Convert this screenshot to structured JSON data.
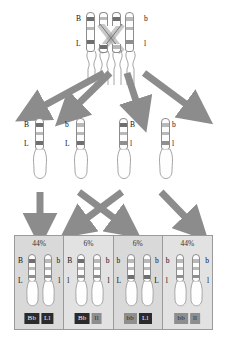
{
  "diagram": {
    "colors": {
      "arrow_gray": "#8c8c8c",
      "panel_bg": "#d9d9d9",
      "panel_bg_alt": "#e2e2e2",
      "band_dark": "#6f6f6f",
      "band_light": "#b9b9b9",
      "geno_dark_bg": "#2b2b2b",
      "geno_grey_bg": "#8e8e8e",
      "outline": "#8d8d8d"
    }
  },
  "tetrad": {
    "stage_label": "tetrad-with-chiasma",
    "left_allele_top": "B",
    "left_allele_bottom": "L",
    "right_allele_top": "b",
    "right_allele_bottom": "l",
    "chromatid_count": 4
  },
  "gametes": {
    "stage_label": "four-gametes",
    "items": [
      {
        "name": "gamete-BL",
        "top": "B",
        "bottom": "L",
        "label_side": "left"
      },
      {
        "name": "gamete-bL",
        "top": "b",
        "bottom": "L",
        "label_side": "left"
      },
      {
        "name": "gamete-Bl",
        "top": "B",
        "bottom": "l",
        "label_side": "right"
      },
      {
        "name": "gamete-bl",
        "top": "b",
        "bottom": "l",
        "label_side": "right"
      }
    ]
  },
  "offspring": {
    "stage_label": "offspring-genotype-classes",
    "cells": [
      {
        "name": "class-parental-BbLl",
        "percent": "44%",
        "left_top": "B",
        "left_bottom": "L",
        "right_top": "b",
        "right_bottom": "l",
        "geno_1": "Bb",
        "geno_1_style": "dark",
        "geno_2": "Ll",
        "geno_2_style": "dark",
        "shade": "dark"
      },
      {
        "name": "class-recombinant-Bbll",
        "percent": "6%",
        "left_top": "B",
        "left_bottom": "l",
        "right_top": "b",
        "right_bottom": "l",
        "geno_1": "Bb",
        "geno_1_style": "dark",
        "geno_2": "ll",
        "geno_2_style": "grey",
        "shade": "light"
      },
      {
        "name": "class-recombinant-bbLl",
        "percent": "6%",
        "left_top": "b",
        "left_bottom": "L",
        "right_top": "b",
        "right_bottom": "L",
        "geno_1": "bb",
        "geno_1_style": "grey",
        "geno_2": "Ll",
        "geno_2_style": "dark",
        "shade": "dark"
      },
      {
        "name": "class-parental-bbll",
        "percent": "44%",
        "left_top": "b",
        "left_bottom": "l",
        "right_top": "b",
        "right_bottom": "l",
        "geno_1": "bb",
        "geno_1_style": "grey",
        "geno_2": "ll",
        "geno_2_style": "grey",
        "shade": "light"
      }
    ]
  },
  "arrows": {
    "meiosis": [
      {
        "name": "arrow-to-gamete-1",
        "direction": "down-left"
      },
      {
        "name": "arrow-to-gamete-2",
        "direction": "down-left-steep"
      },
      {
        "name": "arrow-to-gamete-3",
        "direction": "down"
      },
      {
        "name": "arrow-to-gamete-4",
        "direction": "down-right"
      }
    ],
    "fertilization": [
      {
        "name": "arrow-gamete1-to-class1",
        "direction": "down"
      },
      {
        "name": "arrow-gamete2-to-class3",
        "direction": "down-right-cross"
      },
      {
        "name": "arrow-gamete3-to-class2",
        "direction": "down-left-cross"
      },
      {
        "name": "arrow-gamete4-to-class4",
        "direction": "down-right"
      }
    ]
  }
}
